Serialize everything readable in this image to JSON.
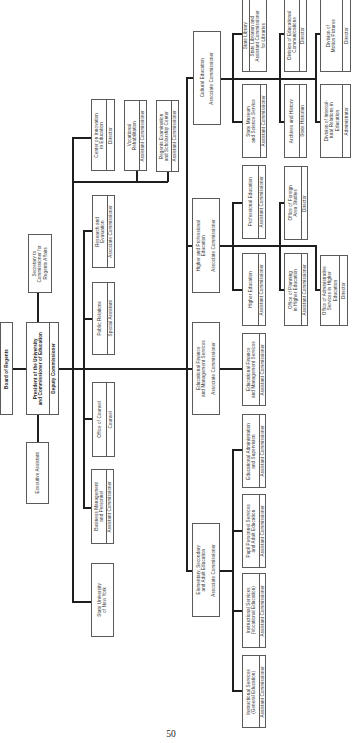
{
  "page_number": "50",
  "top": {
    "board": "Board of Regents",
    "president": {
      "name": "President of the University\nand Commissioner of Education",
      "title": "Deputy Commissioner"
    },
    "secretary": "Secretary to\nCommissioner for\nRegents Affairs",
    "executive_assistant": "Executive Assistant"
  },
  "staff": [
    {
      "name": "Center on Innovation\nin Education",
      "title": "Director"
    },
    {
      "name": "Vocational\nRehabilitation",
      "title": "Assistant Commissioner"
    },
    {
      "name": "Regents Examination\nand Scholarship Center",
      "title": "Assistant Commissioner"
    },
    {
      "name": "Research and\nEvaluation",
      "title": "Associate Commissioner"
    },
    {
      "name": "Public Relations",
      "title": "Special Assistant"
    },
    {
      "name": "Office of Counsel",
      "title": "Counsel"
    },
    {
      "name": "Business Management\nand Personnel",
      "title": "Assistant Commissioner"
    },
    {
      "name": "State University\nof New York"
    }
  ],
  "divisions": [
    {
      "name": "Cultural Education",
      "title": "Associate Commissioner",
      "units": [
        {
          "name": "State Library",
          "title": "State Librarian and\nAssistant Commissioner\nfor Libraries"
        },
        {
          "name": "State Museum\nand Science Service",
          "title": "Assistant Commissioner"
        },
        {
          "name": "Division of Educational\nCommunications",
          "title": "Director"
        },
        {
          "name": "Archives and History",
          "title": "State Historian"
        },
        {
          "name": "Division of\nMotion Pictures",
          "title": "Director"
        },
        {
          "name": "Division of Intercul-\ntural Relations in\nEducation",
          "title": "Administrator"
        }
      ]
    },
    {
      "name": "Higher and Professional\nEducation",
      "title": "Associate Commissioner",
      "units": [
        {
          "name": "Professional Education",
          "title": "Assistant Commissioner"
        },
        {
          "name": "Higher Education",
          "title": "Assistant Commissioner"
        },
        {
          "name": "Office of Foreign\nArea Studies",
          "title": "Director"
        },
        {
          "name": "Office of Planning\nin Higher Education",
          "title": "Assistant Commissioner"
        },
        {
          "name": "Office of Administrative\nServices in Higher\nEducation",
          "title": "Director"
        }
      ]
    },
    {
      "name": "Educational Finance\nand Management Services",
      "title": "Associate Commissioner",
      "units": [
        {
          "name": "Educational Finance\nand Management Services",
          "title": "Assistant Commissioner"
        }
      ]
    },
    {
      "name": "Elementary, Secondary\nand Adult Education",
      "title": "Associate Commissioner",
      "units": [
        {
          "name": "Educational Administration\nand Supervision",
          "title": "Assistant Commissioner"
        },
        {
          "name": "Pupil Personnel Services\nand Adult Education",
          "title": "Assistant Commissioner"
        },
        {
          "name": "Instructional Services\n(Vocational Education)",
          "title": "Assistant Commissioner"
        },
        {
          "name": "Instructional Services\n(General Education)",
          "title": "Assistant Commissioner"
        }
      ]
    }
  ]
}
